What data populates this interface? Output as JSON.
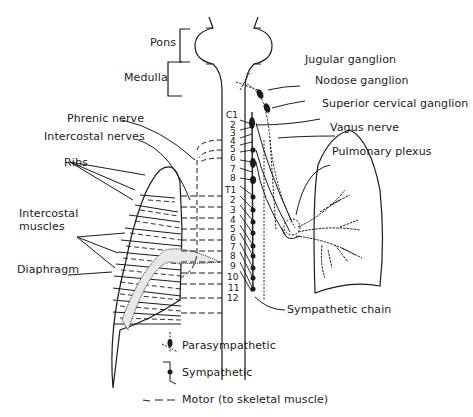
{
  "diagram": {
    "brain_labels": {
      "pons": "Pons",
      "medulla": "Medulla"
    },
    "left_labels": {
      "phrenic_nerve": "Phrenic nerve",
      "intercostal_nerves": "Intercostal nerves",
      "ribs": "Ribs",
      "intercostal_muscles_line1": "Intercostal",
      "intercostal_muscles_line2": "muscles",
      "diaphragm": "Diaphragm"
    },
    "right_labels": {
      "jugular_ganglion": "Jugular ganglion",
      "nodose_ganglion": "Nodose ganglion",
      "superior_cervical_ganglion": "Superior cervical ganglion",
      "vagus_nerve": "Vagus nerve",
      "pulmonary_plexus": "Pulmonary plexus",
      "sympathetic_chain": "Sympathetic chain"
    },
    "cervical_segments": [
      "C1",
      "2",
      "3",
      "4",
      "5",
      "6",
      "7",
      "8"
    ],
    "thoracic_segments": [
      "T1",
      "2",
      "3",
      "4",
      "5",
      "6",
      "7",
      "8",
      "9",
      "10",
      "11",
      "12"
    ],
    "legend": [
      {
        "label": "Parasympathetic",
        "symbol": "parasympathetic-symbol"
      },
      {
        "label": "Sympathetic",
        "symbol": "sympathetic-symbol"
      },
      {
        "label": "Motor (to skeletal muscle)",
        "symbol": "motor-dashed-line"
      }
    ]
  }
}
